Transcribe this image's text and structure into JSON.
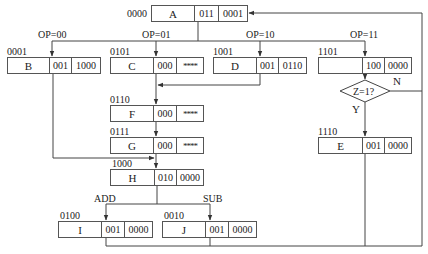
{
  "diagram": {
    "type": "microprogram-flowchart",
    "nodes": {
      "A": {
        "addr": "0000",
        "name": "A",
        "f1": "011",
        "f2": "0001"
      },
      "B": {
        "addr": "0001",
        "name": "B",
        "f1": "001",
        "f2": "1000"
      },
      "C": {
        "addr": "0101",
        "name": "C",
        "f1": "000",
        "f2": "****"
      },
      "D": {
        "addr": "1001",
        "name": "D",
        "f1": "001",
        "f2": "0110"
      },
      "K": {
        "addr": "1101",
        "name": "",
        "f1": "100",
        "f2": "0000"
      },
      "F": {
        "addr": "0110",
        "name": "F",
        "f1": "000",
        "f2": "****"
      },
      "G": {
        "addr": "0111",
        "name": "G",
        "f1": "000",
        "f2": "****"
      },
      "E": {
        "addr": "1110",
        "name": "E",
        "f1": "001",
        "f2": "0000"
      },
      "H": {
        "addr": "1000",
        "name": "H",
        "f1": "010",
        "f2": "0000"
      },
      "I": {
        "addr": "0100",
        "name": "I",
        "f1": "001",
        "f2": "0000"
      },
      "J": {
        "addr": "0010",
        "name": "J",
        "f1": "001",
        "f2": "0000"
      }
    },
    "branch_labels": {
      "op00": "OP=00",
      "op01": "OP=01",
      "op10": "OP=10",
      "op11": "OP=11",
      "add": "ADD",
      "sub": "SUB"
    },
    "decision": {
      "text": "Z=1?",
      "yes": "Y",
      "no": "N"
    },
    "edges": [
      {
        "from": "A",
        "to": "B",
        "label": "OP=00"
      },
      {
        "from": "A",
        "to": "C",
        "label": "OP=01"
      },
      {
        "from": "A",
        "to": "D",
        "label": "OP=10"
      },
      {
        "from": "A",
        "to": "1101",
        "label": "OP=11"
      },
      {
        "from": "C",
        "to": "F"
      },
      {
        "from": "D",
        "to": "F"
      },
      {
        "from": "F",
        "to": "G"
      },
      {
        "from": "G",
        "to": "H"
      },
      {
        "from": "B",
        "to": "H"
      },
      {
        "from": "1101",
        "to": "Z=1?"
      },
      {
        "from": "Z=1?",
        "to": "E",
        "label": "Y"
      },
      {
        "from": "Z=1?",
        "to": "A",
        "label": "N"
      },
      {
        "from": "H",
        "to": "I",
        "label": "ADD"
      },
      {
        "from": "H",
        "to": "J",
        "label": "SUB"
      },
      {
        "from": "I",
        "to": "A"
      },
      {
        "from": "J",
        "to": "A"
      },
      {
        "from": "E",
        "to": "A"
      }
    ]
  }
}
